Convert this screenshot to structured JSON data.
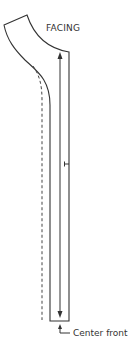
{
  "diagram": {
    "title": "FACING",
    "annotation": "Center front",
    "colors": {
      "stroke": "#333333",
      "background": "#ffffff"
    },
    "elements": {
      "pattern_piece": "facing outline",
      "fold_line": "dashed line",
      "grainline": "double-headed arrow",
      "notch": "T-mark",
      "center_front_pointer": "L-shaped arrow"
    }
  }
}
